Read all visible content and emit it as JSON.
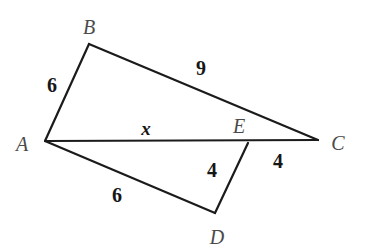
{
  "figure": {
    "type": "geometry-diagram",
    "width": 365,
    "height": 252,
    "background_color": "#ffffff",
    "stroke_color": "#1b1b1b",
    "stroke_width": 2.2
  },
  "points": {
    "A": {
      "label": "A",
      "x": 45,
      "y": 141,
      "label_x": 22,
      "label_y": 144
    },
    "B": {
      "label": "B",
      "x": 89,
      "y": 44,
      "label_x": 89,
      "label_y": 27
    },
    "C": {
      "label": "C",
      "x": 318,
      "y": 140,
      "label_x": 338,
      "label_y": 143
    },
    "D": {
      "label": "D",
      "x": 215,
      "y": 213,
      "label_x": 217,
      "label_y": 237
    },
    "E": {
      "label": "E",
      "x": 248,
      "y": 143,
      "label_x": 239,
      "label_y": 126
    }
  },
  "segments": [
    {
      "name": "segment-AB",
      "from": "A",
      "to": "B"
    },
    {
      "name": "segment-BC",
      "from": "B",
      "to": "C"
    },
    {
      "name": "segment-AC",
      "from": "A",
      "to": "C"
    },
    {
      "name": "segment-AD",
      "from": "A",
      "to": "D"
    },
    {
      "name": "segment-DE",
      "from": "D",
      "to": "E"
    }
  ],
  "measures": [
    {
      "name": "length-AB",
      "text": "6",
      "x": 52,
      "y": 85,
      "style": "length"
    },
    {
      "name": "length-BC",
      "text": "9",
      "x": 201,
      "y": 68,
      "style": "length"
    },
    {
      "name": "length-AE",
      "text": "x",
      "x": 146,
      "y": 128,
      "style": "var"
    },
    {
      "name": "length-ED",
      "text": "4",
      "x": 212,
      "y": 170,
      "style": "length"
    },
    {
      "name": "length-EC",
      "text": "4",
      "x": 278,
      "y": 161,
      "style": "length"
    },
    {
      "name": "length-AD",
      "text": "6",
      "x": 117,
      "y": 195,
      "style": "length"
    }
  ],
  "chart_data": {
    "type": "diagram",
    "title": "",
    "vertices": [
      {
        "id": "A",
        "x": 45,
        "y": 141
      },
      {
        "id": "B",
        "x": 89,
        "y": 44
      },
      {
        "id": "C",
        "x": 318,
        "y": 140
      },
      {
        "id": "D",
        "x": 215,
        "y": 213
      },
      {
        "id": "E",
        "x": 248,
        "y": 143
      }
    ],
    "edges": [
      {
        "from": "A",
        "to": "B",
        "length": "6"
      },
      {
        "from": "B",
        "to": "C",
        "length": "9"
      },
      {
        "from": "A",
        "to": "E",
        "length": "x"
      },
      {
        "from": "E",
        "to": "C",
        "length": "4"
      },
      {
        "from": "A",
        "to": "D",
        "length": "6"
      },
      {
        "from": "D",
        "to": "E",
        "length": "4"
      }
    ],
    "annotations": [
      "6",
      "9",
      "x",
      "4",
      "4",
      "6"
    ]
  }
}
